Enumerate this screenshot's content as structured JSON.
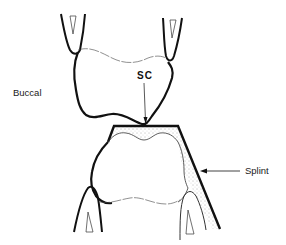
{
  "labels": {
    "buccal": "Buccal",
    "sc": "SC",
    "splint": "Splint"
  },
  "colors": {
    "outline": "#111111",
    "stipple": "#555555",
    "background": "#ffffff"
  }
}
